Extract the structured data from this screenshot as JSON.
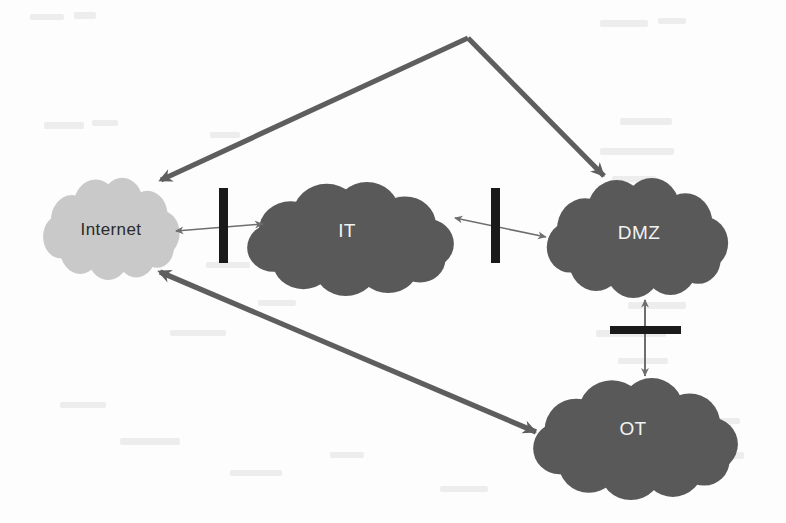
{
  "diagram": {
    "type": "network-zone-diagram",
    "background_color": "#fdfdfd",
    "nodes": [
      {
        "id": "internet",
        "label": "Internet",
        "shape": "cloud",
        "fill_color": "#c9c9c9",
        "label_color": "#2a2a2a",
        "cx": 111,
        "cy": 228,
        "rx": 70,
        "ry": 52
      },
      {
        "id": "it",
        "label": "IT",
        "shape": "cloud",
        "fill_color": "#595959",
        "label_color": "#f2f2f2",
        "cx": 350,
        "cy": 238,
        "rx": 106,
        "ry": 58
      },
      {
        "id": "dmz",
        "label": "DMZ",
        "shape": "cloud",
        "fill_color": "#595959",
        "label_color": "#f2f2f2",
        "cx": 637,
        "cy": 237,
        "rx": 93,
        "ry": 61
      },
      {
        "id": "ot",
        "label": "OT",
        "shape": "cloud",
        "fill_color": "#595959",
        "label_color": "#f2f2f2",
        "cx": 635,
        "cy": 438,
        "rx": 105,
        "ry": 62
      }
    ],
    "barriers": [
      {
        "id": "firewall-internet-it",
        "orientation": "vertical",
        "color": "#1a1a1a",
        "x": 219,
        "y": 188,
        "width": 9,
        "height": 75
      },
      {
        "id": "firewall-it-dmz",
        "orientation": "vertical",
        "color": "#1a1a1a",
        "x": 491,
        "y": 188,
        "width": 9,
        "height": 75
      },
      {
        "id": "firewall-dmz-ot",
        "orientation": "horizontal",
        "color": "#1a1a1a",
        "x": 610,
        "y": 326,
        "width": 71,
        "height": 8
      }
    ],
    "connections": [
      {
        "id": "internet-it-link",
        "from": "internet",
        "to": "it",
        "style": "thin",
        "arrowheads": "both",
        "color": "#6e6e6e",
        "crosses": "firewall-internet-it"
      },
      {
        "id": "it-dmz-link",
        "from": "it",
        "to": "dmz",
        "style": "thin",
        "arrowheads": "both",
        "color": "#6e6e6e",
        "crosses": "firewall-it-dmz"
      },
      {
        "id": "dmz-ot-link",
        "from": "dmz",
        "to": "ot",
        "style": "thin",
        "arrowheads": "both",
        "color": "#6e6e6e",
        "crosses": "firewall-dmz-ot"
      },
      {
        "id": "internet-dmz-bypass",
        "from": "dmz",
        "to": "internet",
        "style": "thick",
        "arrowheads": "both",
        "color": "#5e5e5e",
        "via_apex": true
      },
      {
        "id": "internet-ot-bypass",
        "from": "ot",
        "to": "internet",
        "style": "thick",
        "arrowheads": "both",
        "color": "#5e5e5e",
        "via_apex": false
      }
    ]
  }
}
